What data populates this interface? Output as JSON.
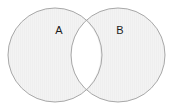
{
  "canvas": {
    "width": 174,
    "height": 109,
    "background_color": "#ffffff"
  },
  "diagram": {
    "type": "venn",
    "title": "",
    "set_count": 2,
    "region_fill_color": "#f2f2f2",
    "region_stroke_color": "#a8a8a8",
    "region_stroke_width": 1,
    "intersection_fill_color": "#ffffff",
    "label_color": "#1c1c1c",
    "label_font_size": 11
  },
  "sets": [
    {
      "id": "A",
      "label": "A",
      "center_x": 55,
      "center_y": 55,
      "radius": 47,
      "label_x": 59,
      "label_y": 31,
      "fill": "#f2f2f2",
      "stroke": "#a8a8a8"
    },
    {
      "id": "B",
      "label": "B",
      "center_x": 118,
      "center_y": 55,
      "radius": 47,
      "label_x": 120,
      "label_y": 31,
      "fill": "#f2f2f2",
      "stroke": "#a8a8a8"
    }
  ],
  "intersection": {
    "id": "AB",
    "label": "",
    "fill": "#ffffff",
    "top_point_x": 86,
    "top_point_y": 21,
    "bottom_point_x": 86,
    "bottom_point_y": 89
  }
}
